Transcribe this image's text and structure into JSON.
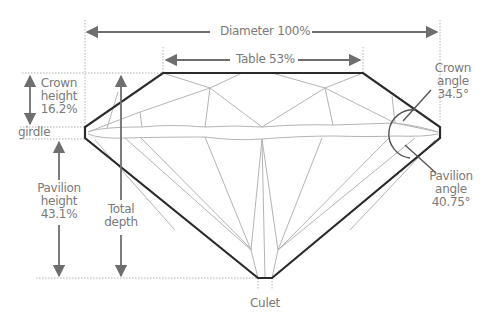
{
  "diagram": {
    "colors": {
      "outline": "#2a2a2a",
      "facet": "#b4b4b4",
      "arrow": "#6e6e6e",
      "guide": "#b0b0b0",
      "text": "#7a7a7a"
    },
    "labels": {
      "diameter": "Diameter 100%",
      "table": "Table 53%",
      "crown_height": [
        "Crown",
        "height",
        "16.2%"
      ],
      "girdle": "girdle",
      "pavilion_height": [
        "Pavilion",
        "height",
        "43.1%"
      ],
      "total_depth": [
        "Total",
        "depth"
      ],
      "crown_angle": [
        "Crown",
        "angle",
        "34.5°"
      ],
      "pavilion_angle": [
        "Pavilion",
        "angle",
        "40.75°"
      ],
      "culet": "Culet"
    },
    "measurements": {
      "diameter_pct": 100,
      "table_pct": 53,
      "crown_height_pct": 16.2,
      "pavilion_height_pct": 43.1,
      "crown_angle_deg": 34.5,
      "pavilion_angle_deg": 40.75
    }
  }
}
